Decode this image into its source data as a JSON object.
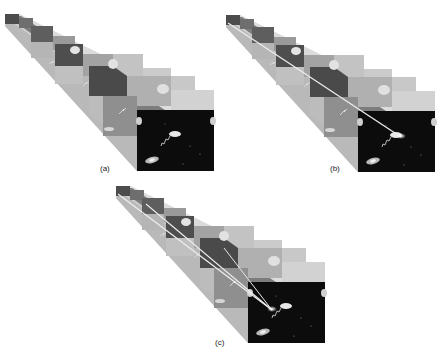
{
  "figure": {
    "panels": [
      {
        "id": "a",
        "label": "(a)",
        "rays": 0
      },
      {
        "id": "b",
        "label": "(b)",
        "rays": 1
      },
      {
        "id": "c",
        "label": "(c)",
        "rays": 2
      }
    ],
    "colors": {
      "background": "#ffffff",
      "base_image": "#0c0c0c",
      "level_light": "#d6d6d6",
      "level_mid": "#a8a8a8",
      "level_dark": "#6a6a6a",
      "ray": "#e8e8e8"
    }
  }
}
